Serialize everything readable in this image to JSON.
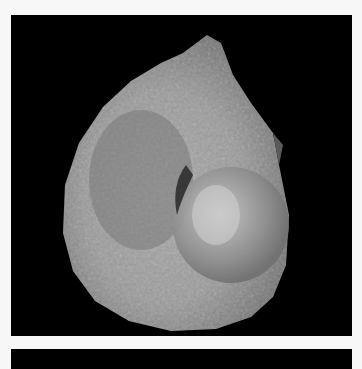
{
  "image": {
    "subject": "ammonite fossil photographed on black background",
    "background_color": "#f7f7f7",
    "panel_color": "#000000",
    "fossil_tone_light": "#b9b9b9",
    "fossil_tone_dark": "#6a6a6a"
  }
}
